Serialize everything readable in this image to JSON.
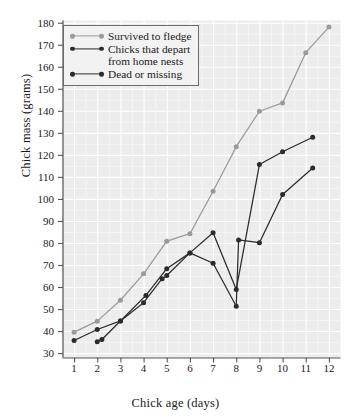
{
  "chart_data": {
    "type": "line",
    "title": "",
    "xlabel": "Chick age (days)",
    "ylabel": "Chick mass (grams)",
    "xlim": [
      0.5,
      12.5
    ],
    "ylim": [
      28,
      181
    ],
    "xticks": [
      1,
      2,
      3,
      4,
      5,
      6,
      7,
      8,
      9,
      10,
      11,
      12
    ],
    "yticks": [
      30,
      40,
      50,
      60,
      70,
      80,
      90,
      100,
      110,
      120,
      130,
      140,
      150,
      160,
      170,
      180
    ],
    "grid": true,
    "legend_position": "top-left",
    "plot_background": "#ececec",
    "gridline_color": "#ffffff",
    "series": [
      {
        "name": "Survived to fledge",
        "color": "#9a9a9a",
        "marker": "circle",
        "x": [
          1,
          2,
          3,
          4,
          5,
          6,
          7,
          8,
          9,
          10,
          11,
          12
        ],
        "y": [
          39.5,
          44.5,
          54,
          66,
          80.8,
          84.2,
          103.5,
          123.7,
          139.8,
          143.6,
          166.4,
          178
        ]
      },
      {
        "name": "Chicks that depart from home nests",
        "color": "#2b2b2b",
        "marker": "circle",
        "x": [
          1,
          2,
          3,
          4.1,
          5,
          6,
          7,
          8,
          9,
          10,
          11.3
        ],
        "y": [
          35.7,
          40.7,
          44.6,
          56.2,
          68.3,
          75.5,
          84.6,
          58.9,
          115.6,
          121.4,
          128
        ]
      },
      {
        "name": "Dead or missing",
        "color": "#2b2b2b",
        "marker": "circle",
        "x": [
          2,
          2.2,
          3,
          4,
          4.8,
          5,
          6,
          7,
          8,
          8.1,
          9,
          10,
          11.3
        ],
        "y": [
          35.1,
          36.2,
          44.6,
          52.9,
          63.8,
          65.2,
          75.5,
          70.8,
          51.3,
          81.4,
          80.1,
          102,
          114
        ]
      }
    ]
  },
  "legend": {
    "entries": [
      {
        "label_line1": "Survived to fledge",
        "label_line2": ""
      },
      {
        "label_line1": "Chicks that depart",
        "label_line2": "from home nests"
      },
      {
        "label_line1": "Dead or missing",
        "label_line2": ""
      }
    ]
  }
}
